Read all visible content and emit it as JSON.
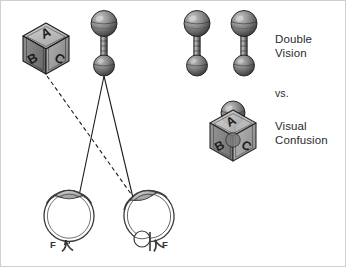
{
  "figure": {
    "name": "double-vision-vs-visual-confusion-diagram",
    "background_color": "#ffffff",
    "border_color": "#cfcfcf",
    "width": 346,
    "height": 267
  },
  "labels": {
    "double_vision": "Double\nVision",
    "versus": "vs.",
    "visual_confusion": "Visual\nConfusion",
    "fovea_left": "F",
    "fovea_right": "F"
  },
  "objects": {
    "cube": {
      "name": "lettered-cube",
      "face_top": "A",
      "face_left": "B",
      "face_right": "C",
      "fill_light": "#c9c9c9",
      "fill_mid": "#a3a3a3",
      "fill_dark": "#7d7d7d",
      "outline": "#1c1c1c"
    },
    "dumbbell": {
      "name": "dumbbell-object",
      "fill_light": "#b4b4b4",
      "fill_dark": "#4a4a4a",
      "outline": "#1c1c1c"
    },
    "eye": {
      "name": "eyeball-cross-section",
      "outline": "#3a3a3a",
      "lens_fill": "#b9b9b9",
      "sclera_fill": "#ffffff"
    }
  },
  "rays": {
    "solid_color": "#1c1c1c",
    "dashed_color": "#1c1c1c",
    "dash_pattern": "4 3",
    "solid_description": "visual axis rays from dumbbell to both foveae",
    "dashed_description": "ray from cube to deviated right eye"
  },
  "colors": {
    "text": "#2b2b2b",
    "line": "#1c1c1c",
    "border": "#cfcfcf"
  }
}
